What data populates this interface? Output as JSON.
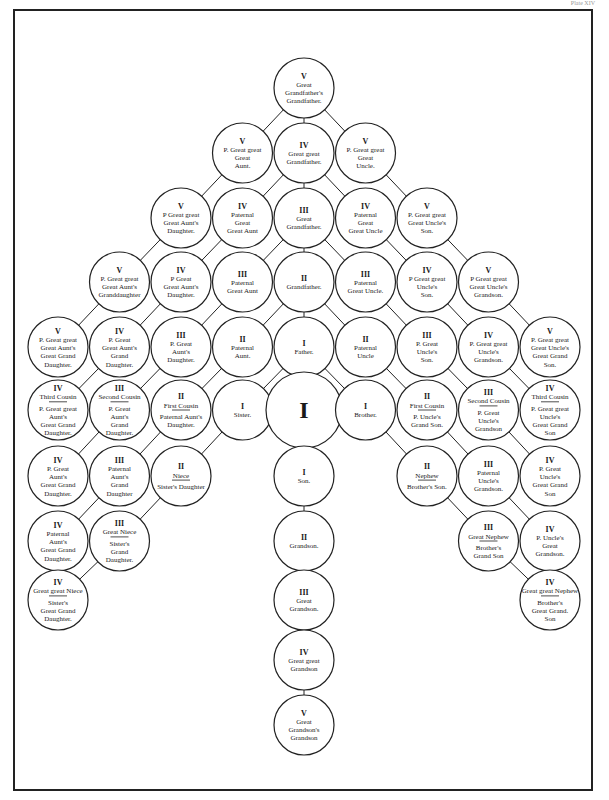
{
  "page": {
    "header_left": "",
    "header_right": "Plate XIV"
  },
  "diagram": {
    "type": "genealogical consanguinity tree",
    "nodes": [
      {
        "id": "ggf_gf",
        "col": 5,
        "row": 0,
        "degree": "V",
        "lines": [
          "Great",
          "Grandfather's",
          "Grandfather."
        ],
        "big": false
      },
      {
        "id": "pggg_aunt",
        "col": 4,
        "row": 1,
        "degree": "V",
        "lines": [
          "P. Great great",
          "Great",
          "Aunt."
        ]
      },
      {
        "id": "gg_gf",
        "col": 5,
        "row": 1,
        "degree": "IV",
        "lines": [
          "Great great",
          "Grandfather."
        ]
      },
      {
        "id": "pggg_uncle",
        "col": 6,
        "row": 1,
        "degree": "V",
        "lines": [
          "P. Great great",
          "Great",
          "Uncle."
        ]
      },
      {
        "id": "pggg_aunt_dau",
        "col": 3,
        "row": 2,
        "degree": "V",
        "lines": [
          "P Great great",
          "Great Aunt's",
          "Daughter."
        ]
      },
      {
        "id": "pat_gg_aunt",
        "col": 4,
        "row": 2,
        "degree": "IV",
        "lines": [
          "Paternal",
          "Great",
          "Great Aunt"
        ]
      },
      {
        "id": "g_gf",
        "col": 5,
        "row": 2,
        "degree": "III",
        "lines": [
          "Great",
          "Grandfather."
        ]
      },
      {
        "id": "pat_gg_uncle",
        "col": 6,
        "row": 2,
        "degree": "IV",
        "lines": [
          "Paternal",
          "Great",
          "Great Uncle"
        ]
      },
      {
        "id": "pggg_uncle_son",
        "col": 7,
        "row": 2,
        "degree": "V",
        "lines": [
          "P. Great great",
          "Great Uncle's",
          "Son."
        ]
      },
      {
        "id": "pgg_aunt_gdau",
        "col": 2,
        "row": 3,
        "degree": "V",
        "lines": [
          "P. Great great",
          "Great Aunt's",
          "Granddaughter"
        ]
      },
      {
        "id": "pgg_aunt_dau",
        "col": 3,
        "row": 3,
        "degree": "IV",
        "lines": [
          "P Great",
          "Great Aunt's",
          "Daughter."
        ]
      },
      {
        "id": "pat_g_aunt",
        "col": 4,
        "row": 3,
        "degree": "III",
        "lines": [
          "Paternal",
          "Great Aunt"
        ]
      },
      {
        "id": "gf",
        "col": 5,
        "row": 3,
        "degree": "II",
        "lines": [
          "Grandfather."
        ]
      },
      {
        "id": "pat_g_uncle",
        "col": 6,
        "row": 3,
        "degree": "III",
        "lines": [
          "Paternal",
          "Great Uncle."
        ]
      },
      {
        "id": "pgg_uncle_son",
        "col": 7,
        "row": 3,
        "degree": "IV",
        "lines": [
          "P Great great",
          "Uncle's",
          "Son."
        ]
      },
      {
        "id": "pgg_uncle_gson",
        "col": 8,
        "row": 3,
        "degree": "V",
        "lines": [
          "P Great great",
          "Great Uncle's",
          "Grandson."
        ]
      },
      {
        "id": "pgg_aunt_ggdau",
        "col": 1,
        "row": 4,
        "degree": "V",
        "lines": [
          "P. Great great",
          "Great Aunt's",
          "Great Grand",
          "Daughter."
        ]
      },
      {
        "id": "pg_aunt_gdau",
        "col": 2,
        "row": 4,
        "degree": "IV",
        "lines": [
          "P. Great",
          "Great Aunt's",
          "Grand",
          "Daughter."
        ]
      },
      {
        "id": "pg_aunt_dau",
        "col": 3,
        "row": 4,
        "degree": "III",
        "lines": [
          "P. Great",
          "Aunt's",
          "Daughter."
        ]
      },
      {
        "id": "pat_aunt",
        "col": 4,
        "row": 4,
        "degree": "II",
        "lines": [
          "Paternal",
          "Aunt."
        ]
      },
      {
        "id": "father",
        "col": 5,
        "row": 4,
        "degree": "I",
        "lines": [
          "Father."
        ]
      },
      {
        "id": "pat_uncle",
        "col": 6,
        "row": 4,
        "degree": "II",
        "lines": [
          "Paternal",
          "Uncle"
        ]
      },
      {
        "id": "pg_uncle_son",
        "col": 7,
        "row": 4,
        "degree": "III",
        "lines": [
          "P. Great",
          "Uncle's",
          "Son."
        ]
      },
      {
        "id": "pgg_uncle_gson2",
        "col": 8,
        "row": 4,
        "degree": "IV",
        "lines": [
          "P. Great great",
          "Uncle's",
          "Grandson."
        ]
      },
      {
        "id": "pgg_uncle_ggson",
        "col": 9,
        "row": 4,
        "degree": "V",
        "lines": [
          "P. Great great",
          "Great Uncle's",
          "Great Grand",
          "Son."
        ]
      },
      {
        "id": "third_cousin_f",
        "col": 1,
        "row": 5,
        "degree": "IV",
        "title": "Third Cousin",
        "lines": [
          "P. Great great",
          "Aunt's",
          "Great Grand",
          "Daughter."
        ]
      },
      {
        "id": "second_cousin_f",
        "col": 2,
        "row": 5,
        "degree": "III",
        "title": "Second Cousin",
        "lines": [
          "P. Great",
          "Aunt's",
          "Grand",
          "Daughter."
        ]
      },
      {
        "id": "first_cousin_f",
        "col": 3,
        "row": 5,
        "degree": "II",
        "title": "First Cousin",
        "lines": [
          "Paternal Aunt's",
          "Daughter."
        ]
      },
      {
        "id": "sister",
        "col": 4,
        "row": 5,
        "degree": "I",
        "lines": [
          "Sister."
        ]
      },
      {
        "id": "self",
        "col": 5,
        "row": 5,
        "degree": "I",
        "lines": [],
        "big": true
      },
      {
        "id": "brother",
        "col": 6,
        "row": 5,
        "degree": "I",
        "lines": [
          "Brother."
        ]
      },
      {
        "id": "first_cousin_m",
        "col": 7,
        "row": 5,
        "degree": "II",
        "title": "First Cousin",
        "lines": [
          "P. Uncle's",
          "Grand Son."
        ]
      },
      {
        "id": "second_cousin_m",
        "col": 8,
        "row": 5,
        "degree": "III",
        "title": "Second Cousin",
        "lines": [
          "P. Great",
          "Uncle's",
          "Grandson"
        ]
      },
      {
        "id": "third_cousin_m",
        "col": 9,
        "row": 5,
        "degree": "IV",
        "title": "Third Cousin",
        "lines": [
          "P. Great great",
          "Uncle's",
          "Great Grand",
          "Son"
        ]
      },
      {
        "id": "pg_aunt_ggdau",
        "col": 1,
        "row": 6,
        "degree": "IV",
        "lines": [
          "P. Great",
          "Aunt's",
          "Great Grand",
          "Daughter."
        ]
      },
      {
        "id": "pat_aunt_gdau",
        "col": 2,
        "row": 6,
        "degree": "III",
        "lines": [
          "Paternal",
          "Aunt's",
          "Grand",
          "Daughter"
        ]
      },
      {
        "id": "niece",
        "col": 3,
        "row": 6,
        "degree": "II",
        "title": "Niece",
        "lines": [
          "Sister's Daughter"
        ]
      },
      {
        "id": "son",
        "col": 5,
        "row": 6,
        "degree": "I",
        "lines": [
          "Son."
        ]
      },
      {
        "id": "nephew",
        "col": 7,
        "row": 6,
        "degree": "II",
        "title": "Nephew",
        "lines": [
          "Brother's Son."
        ]
      },
      {
        "id": "pat_uncle_gson",
        "col": 8,
        "row": 6,
        "degree": "III",
        "lines": [
          "Paternal",
          "Uncle's",
          "Grandson."
        ]
      },
      {
        "id": "pg_uncle_ggson",
        "col": 9,
        "row": 6,
        "degree": "IV",
        "lines": [
          "P. Great",
          "Uncle's",
          "Great Grand",
          "Son"
        ]
      },
      {
        "id": "pat_aunt_ggdau",
        "col": 1,
        "row": 7,
        "degree": "IV",
        "lines": [
          "Paternal",
          "Aunt's",
          "Great Grand",
          "Daughter."
        ]
      },
      {
        "id": "great_niece",
        "col": 2,
        "row": 7,
        "degree": "III",
        "title": "Great Niece",
        "lines": [
          "Sister's",
          "Grand",
          "Daughter."
        ]
      },
      {
        "id": "grandson",
        "col": 5,
        "row": 7,
        "degree": "II",
        "lines": [
          "Grandson."
        ]
      },
      {
        "id": "great_nephew",
        "col": 8,
        "row": 7,
        "degree": "III",
        "title": "Great Nephew",
        "lines": [
          "Brother's",
          "Grand Son"
        ]
      },
      {
        "id": "p_uncle_ggson",
        "col": 9,
        "row": 7,
        "degree": "IV",
        "lines": [
          "P. Uncle's",
          "Great",
          "Grandson."
        ]
      },
      {
        "id": "gg_niece",
        "col": 1,
        "row": 8,
        "degree": "IV",
        "title": "Great great Niece",
        "lines": [
          "Sister's",
          "Great Grand",
          "Daughter."
        ]
      },
      {
        "id": "g_grandson",
        "col": 5,
        "row": 8,
        "degree": "III",
        "lines": [
          "Great",
          "Grandson."
        ]
      },
      {
        "id": "gg_nephew",
        "col": 9,
        "row": 8,
        "degree": "IV",
        "title": "Great great Nephew",
        "lines": [
          "Brother's",
          "Great Grand.",
          "Son"
        ]
      },
      {
        "id": "gg_grandson",
        "col": 5,
        "row": 9,
        "degree": "IV",
        "lines": [
          "Great great",
          "Grandson"
        ]
      },
      {
        "id": "ggg_grandson",
        "col": 5,
        "row": 10,
        "degree": "V",
        "lines": [
          "Great",
          "Grandson's",
          "Grandson"
        ]
      }
    ],
    "edges": [
      [
        "ggf_gf",
        "pggg_aunt"
      ],
      [
        "ggf_gf",
        "gg_gf"
      ],
      [
        "ggf_gf",
        "pggg_uncle"
      ],
      [
        "pggg_aunt",
        "pggg_aunt_dau"
      ],
      [
        "gg_gf",
        "pat_gg_aunt"
      ],
      [
        "gg_gf",
        "g_gf"
      ],
      [
        "gg_gf",
        "pat_gg_uncle"
      ],
      [
        "pggg_uncle",
        "pggg_uncle_son"
      ],
      [
        "pggg_aunt_dau",
        "pgg_aunt_gdau"
      ],
      [
        "pat_gg_aunt",
        "pgg_aunt_dau"
      ],
      [
        "g_gf",
        "pat_g_aunt"
      ],
      [
        "g_gf",
        "gf"
      ],
      [
        "g_gf",
        "pat_g_uncle"
      ],
      [
        "pat_gg_uncle",
        "pgg_uncle_son"
      ],
      [
        "pggg_uncle_son",
        "pgg_uncle_gson"
      ],
      [
        "pgg_aunt_gdau",
        "pgg_aunt_ggdau"
      ],
      [
        "pgg_aunt_dau",
        "pg_aunt_gdau"
      ],
      [
        "pat_g_aunt",
        "pg_aunt_dau"
      ],
      [
        "gf",
        "pat_aunt"
      ],
      [
        "gf",
        "father"
      ],
      [
        "gf",
        "pat_uncle"
      ],
      [
        "pat_g_uncle",
        "pg_uncle_son"
      ],
      [
        "pgg_uncle_son",
        "pgg_uncle_gson2"
      ],
      [
        "pgg_uncle_gson",
        "pgg_uncle_ggson"
      ],
      [
        "pg_aunt_gdau",
        "third_cousin_f"
      ],
      [
        "pg_aunt_dau",
        "second_cousin_f"
      ],
      [
        "pat_aunt",
        "first_cousin_f"
      ],
      [
        "father",
        "sister"
      ],
      [
        "father",
        "self"
      ],
      [
        "father",
        "brother"
      ],
      [
        "pat_uncle",
        "first_cousin_m"
      ],
      [
        "pg_uncle_son",
        "second_cousin_m"
      ],
      [
        "pgg_uncle_gson2",
        "third_cousin_m"
      ],
      [
        "second_cousin_f",
        "pg_aunt_ggdau"
      ],
      [
        "first_cousin_f",
        "pat_aunt_gdau"
      ],
      [
        "sister",
        "niece"
      ],
      [
        "self",
        "son"
      ],
      [
        "brother",
        "nephew"
      ],
      [
        "first_cousin_m",
        "pat_uncle_gson"
      ],
      [
        "second_cousin_m",
        "pg_uncle_ggson"
      ],
      [
        "pat_aunt_gdau",
        "pat_aunt_ggdau"
      ],
      [
        "niece",
        "great_niece"
      ],
      [
        "son",
        "grandson"
      ],
      [
        "nephew",
        "great_nephew"
      ],
      [
        "pat_uncle_gson",
        "p_uncle_ggson"
      ],
      [
        "great_niece",
        "gg_niece"
      ],
      [
        "grandson",
        "g_grandson"
      ],
      [
        "great_nephew",
        "gg_nephew"
      ],
      [
        "g_grandson",
        "gg_grandson"
      ],
      [
        "gg_grandson",
        "ggg_grandson"
      ]
    ]
  }
}
